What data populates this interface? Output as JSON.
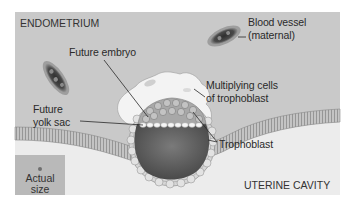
{
  "diagram": {
    "type": "biological-illustration",
    "colors": {
      "endometrium": "#c9c9c9",
      "uterine_cavity": "#ececec",
      "lining_band": "#b5b5b5",
      "blastocyst_interior": "#5e5e5e",
      "trophoblast_cells": "#d2d2d2",
      "multiplying_trophoblast": "#f3f3f3",
      "blood_vessel": "#3a3a3a",
      "actual_size_box": "#b9b9b9",
      "label_text": "#2a2a2a"
    },
    "regions": {
      "endometrium": "ENDOMETRIUM",
      "uterine_cavity": "UTERINE CAVITY"
    },
    "labels": {
      "blood_vessel_line1": "Blood vessel",
      "blood_vessel_line2": "(maternal)",
      "future_embryo": "Future embryo",
      "multiplying_line1": "Multiplying cells",
      "multiplying_line2": "of trophoblast",
      "future_yolk_line1": "Future",
      "future_yolk_line2": "yolk sac",
      "trophoblast": "Trophoblast"
    },
    "actual_size": {
      "line1": "Actual",
      "line2": "size"
    }
  }
}
